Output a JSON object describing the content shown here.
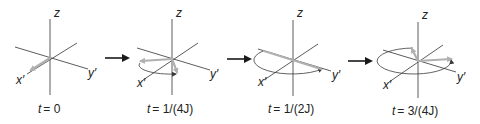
{
  "figure": {
    "colors": {
      "axis": "#4a4a4a",
      "vector": "#b0b0b0",
      "arrow": "#1a1a1a"
    },
    "axis_labels": {
      "z": "z",
      "x": "x′",
      "y": "y′"
    },
    "panels": [
      {
        "id": "p0",
        "time_var": "t",
        "time_value": "= 0"
      },
      {
        "id": "p1",
        "time_var": "t",
        "time_value": "= 1/(4J)"
      },
      {
        "id": "p2",
        "time_var": "t",
        "time_value": "= 1/(2J)"
      },
      {
        "id": "p3",
        "time_var": "t",
        "time_value": "= 3/(4J)"
      }
    ]
  }
}
